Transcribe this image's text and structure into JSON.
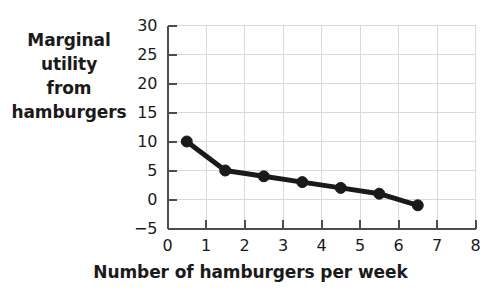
{
  "chart_data": {
    "type": "line",
    "title": "",
    "xlabel": "Number of hamburgers per week",
    "ylabel": "Marginal utility from hamburgers",
    "ylabel_lines": [
      "Marginal",
      "utility",
      "from",
      "hamburgers"
    ],
    "x": [
      0.5,
      1.5,
      2.5,
      3.5,
      4.5,
      5.5,
      6.5
    ],
    "values": [
      10,
      5,
      4,
      3,
      2,
      1,
      -1
    ],
    "series": [
      {
        "name": "Marginal utility from hamburgers",
        "x": [
          0.5,
          1.5,
          2.5,
          3.5,
          4.5,
          5.5,
          6.5
        ],
        "values": [
          10,
          5,
          4,
          3,
          2,
          1,
          -1
        ]
      }
    ],
    "xlim": [
      0,
      8
    ],
    "ylim": [
      -5,
      30
    ],
    "xticks": [
      0,
      1,
      2,
      3,
      4,
      5,
      6,
      7,
      8
    ],
    "xtick_labels": [
      "0",
      "1",
      "2",
      "3",
      "4",
      "5",
      "6",
      "7",
      "8"
    ],
    "yticks": [
      -5,
      0,
      5,
      10,
      15,
      20,
      25,
      30
    ],
    "ytick_labels": [
      "−5",
      "0",
      "5",
      "10",
      "15",
      "20",
      "25",
      "30"
    ],
    "grid": true,
    "grid_color": "#d9d9d9",
    "legend": null,
    "line_color": "#1a1a1a",
    "marker_color": "#1a1a1a",
    "marker": "circle",
    "axis_color": "#4d4d4d"
  }
}
